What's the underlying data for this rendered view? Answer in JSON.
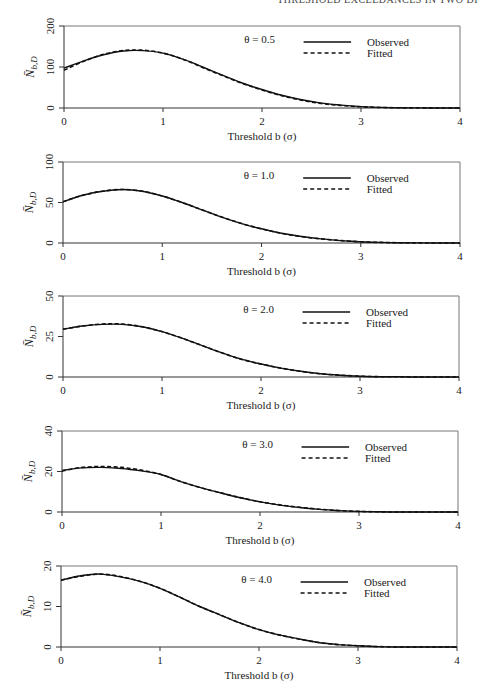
{
  "running_head": "THRESHOLD EXCEEDANCES IN TWO DI",
  "chart_data": [
    {
      "type": "line",
      "title": "",
      "annotation": "θ = 0.5",
      "xlabel": "Threshold  b (σ)",
      "ylabel": "N̄b,D",
      "xlim": [
        0,
        4
      ],
      "ylim": [
        0,
        200
      ],
      "xticks": [
        "0",
        "1",
        "2",
        "3",
        "4"
      ],
      "yticks": [
        "0",
        "100",
        "200"
      ],
      "legend": [
        "Observed",
        "Fitted"
      ],
      "grid": false,
      "x": [
        0,
        0.2,
        0.4,
        0.6,
        0.8,
        1.0,
        1.2,
        1.4,
        1.6,
        1.8,
        2.0,
        2.2,
        2.4,
        2.6,
        2.8,
        3.0,
        3.2,
        3.4,
        3.6,
        3.8,
        4.0
      ],
      "series": [
        {
          "name": "Observed",
          "values": [
            97,
            115,
            130,
            139,
            140,
            134,
            119,
            100,
            80,
            61,
            45,
            31,
            20,
            12,
            7,
            3.5,
            1.5,
            0.6,
            0.2,
            0.1,
            0
          ]
        },
        {
          "name": "Fitted",
          "values": [
            92,
            114,
            131,
            140,
            141,
            134,
            119,
            99,
            79,
            60,
            44,
            30,
            19,
            11,
            6,
            3,
            1.3,
            0.5,
            0.2,
            0.1,
            0
          ]
        }
      ]
    },
    {
      "type": "line",
      "annotation": "θ = 1.0",
      "xlabel": "Threshold  b (σ)",
      "ylabel": "N̄b,D",
      "xlim": [
        0,
        4
      ],
      "ylim": [
        0,
        100
      ],
      "xticks": [
        "0",
        "1",
        "2",
        "3",
        "4"
      ],
      "yticks": [
        "0",
        "50",
        "100"
      ],
      "legend": [
        "Observed",
        "Fitted"
      ],
      "grid": false,
      "x": [
        0,
        0.2,
        0.4,
        0.6,
        0.8,
        1.0,
        1.2,
        1.4,
        1.6,
        1.8,
        2.0,
        2.2,
        2.4,
        2.6,
        2.8,
        3.0,
        3.2,
        3.4,
        3.6,
        3.8,
        4.0
      ],
      "series": [
        {
          "name": "Observed",
          "values": [
            51,
            59,
            64,
            66,
            64,
            58,
            50,
            41,
            32,
            24,
            17.5,
            12,
            8,
            5,
            3,
            1.5,
            0.7,
            0.3,
            0.1,
            0,
            0
          ]
        },
        {
          "name": "Fitted",
          "values": [
            51,
            59,
            64,
            66,
            64,
            58,
            50,
            41,
            32,
            24,
            17.5,
            12,
            8,
            5,
            3,
            1.5,
            0.7,
            0.3,
            0.1,
            0,
            0
          ]
        }
      ]
    },
    {
      "type": "line",
      "annotation": "θ = 2.0",
      "xlabel": "Threshold  b (σ)",
      "ylabel": "N̄b,D",
      "xlim": [
        0,
        4
      ],
      "ylim": [
        0,
        50
      ],
      "xticks": [
        "0",
        "1",
        "2",
        "3",
        "4"
      ],
      "yticks": [
        "0",
        "25",
        "50"
      ],
      "legend": [
        "Observed",
        "Fitted"
      ],
      "grid": false,
      "x": [
        0,
        0.2,
        0.4,
        0.6,
        0.8,
        1.0,
        1.2,
        1.4,
        1.6,
        1.8,
        2.0,
        2.2,
        2.4,
        2.6,
        2.8,
        3.0,
        3.2,
        3.4,
        3.6,
        3.8,
        4.0
      ],
      "series": [
        {
          "name": "Observed",
          "values": [
            29.5,
            31.5,
            32.5,
            32.5,
            31,
            28,
            24,
            19.5,
            15,
            11,
            8,
            5.5,
            3.5,
            2,
            1.1,
            0.5,
            0.2,
            0.1,
            0,
            0,
            0
          ]
        },
        {
          "name": "Fitted",
          "values": [
            29.5,
            31.5,
            32.7,
            32.7,
            31,
            28,
            24,
            19.5,
            15,
            11,
            8,
            5.5,
            3.5,
            2,
            1.1,
            0.5,
            0.2,
            0.1,
            0,
            0,
            0
          ]
        }
      ]
    },
    {
      "type": "line",
      "annotation": "θ = 3.0",
      "xlabel": "Threshold  b (σ)",
      "ylabel": "N̄b,D",
      "xlim": [
        0,
        4
      ],
      "ylim": [
        0,
        40
      ],
      "xticks": [
        "0",
        "1",
        "2",
        "3",
        "4"
      ],
      "yticks": [
        "0",
        "20",
        "40"
      ],
      "legend": [
        "Observed",
        "Fitted"
      ],
      "grid": false,
      "x": [
        0,
        0.2,
        0.4,
        0.6,
        0.8,
        1.0,
        1.2,
        1.4,
        1.6,
        1.8,
        2.0,
        2.2,
        2.4,
        2.6,
        2.8,
        3.0,
        3.2,
        3.4,
        3.6,
        3.8,
        4.0
      ],
      "series": [
        {
          "name": "Observed",
          "values": [
            20.5,
            21.8,
            22,
            21.5,
            20.3,
            18.5,
            15,
            12,
            9.5,
            7,
            5,
            3.4,
            2.2,
            1.3,
            0.7,
            0.3,
            0.1,
            0,
            0,
            0,
            0
          ]
        },
        {
          "name": "Fitted",
          "values": [
            20.2,
            22,
            22.4,
            22,
            20.7,
            18.5,
            15,
            12,
            9.5,
            7.1,
            5.1,
            3.5,
            2.3,
            1.4,
            0.7,
            0.3,
            0.1,
            0,
            0,
            0,
            0
          ]
        }
      ]
    },
    {
      "type": "line",
      "annotation": "θ = 4.0",
      "xlabel": "Threshold  b (σ)",
      "ylabel": "N̄b,D",
      "xlim": [
        0,
        4
      ],
      "ylim": [
        0,
        20
      ],
      "xticks": [
        "0",
        "1",
        "2",
        "3",
        "4"
      ],
      "yticks": [
        "0",
        "10",
        "20"
      ],
      "legend": [
        "Observed",
        "Fitted"
      ],
      "grid": false,
      "x": [
        0,
        0.2,
        0.4,
        0.6,
        0.8,
        1.0,
        1.2,
        1.4,
        1.6,
        1.8,
        2.0,
        2.2,
        2.4,
        2.6,
        2.8,
        3.0,
        3.2,
        3.4,
        3.6,
        3.8,
        4.0
      ],
      "series": [
        {
          "name": "Observed",
          "values": [
            16.5,
            17.6,
            18,
            17.3,
            16.2,
            14.5,
            12.3,
            10,
            8,
            6,
            4.3,
            3,
            2,
            1.1,
            0.6,
            0.3,
            0.1,
            0,
            0,
            0,
            0
          ]
        },
        {
          "name": "Fitted",
          "values": [
            16.5,
            17.5,
            18,
            17.4,
            16.2,
            14.5,
            12.3,
            10,
            8,
            6,
            4.3,
            3,
            2,
            1.1,
            0.6,
            0.3,
            0.1,
            0,
            0,
            0,
            0
          ]
        }
      ]
    }
  ],
  "panels_layout": [
    {
      "left": 64,
      "right": 460,
      "top": 26,
      "bottom": 108
    },
    {
      "left": 63,
      "right": 460,
      "top": 162,
      "bottom": 243
    },
    {
      "left": 63,
      "right": 459,
      "top": 296,
      "bottom": 377
    },
    {
      "left": 62,
      "right": 458,
      "top": 431,
      "bottom": 512
    },
    {
      "left": 61,
      "right": 457,
      "top": 566,
      "bottom": 647
    }
  ]
}
